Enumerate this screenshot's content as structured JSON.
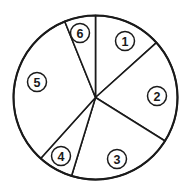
{
  "figure": {
    "kind": "pie-chart-diagram",
    "title": "",
    "background_color": "#ffffff",
    "stroke_color": "#1a1a1a",
    "fill_color": "#ffffff"
  },
  "geometry": {
    "center_x": 95.5,
    "center_y": 97.5,
    "radius": 82,
    "outline_stroke_width": 2.1,
    "divider_stroke_width": 1.6,
    "label_radius": 58,
    "label_ring_radius": 9.5
  },
  "chart_data": {
    "type": "pie",
    "title": "",
    "xlabel": "",
    "ylabel": "",
    "legend_position": "none",
    "grid": false,
    "labels_style": "circled-numbers-inside-slices",
    "start_angle_deg_from_12oclock": 0,
    "direction": "clockwise",
    "categories": [
      "1",
      "2",
      "3",
      "4",
      "5",
      "6"
    ],
    "values": [
      48,
      74,
      75,
      25,
      116,
      22
    ],
    "unit": "degrees",
    "boundary_angles_deg": [
      0,
      48,
      122,
      197,
      222,
      338,
      360
    ],
    "slices": [
      {
        "label": "1",
        "label_glyph": "①",
        "start_angle_deg": 0,
        "end_angle_deg": 48,
        "sweep_deg": 48,
        "fraction_percent": 13.3,
        "label_x": 125,
        "label_y": 41
      },
      {
        "label": "2",
        "label_glyph": "②",
        "start_angle_deg": 48,
        "end_angle_deg": 122,
        "sweep_deg": 74,
        "fraction_percent": 20.6,
        "label_x": 157,
        "label_y": 96
      },
      {
        "label": "3",
        "label_glyph": "③",
        "start_angle_deg": 122,
        "end_angle_deg": 197,
        "sweep_deg": 75,
        "fraction_percent": 20.8,
        "label_x": 117,
        "label_y": 159
      },
      {
        "label": "4",
        "label_glyph": "④",
        "start_angle_deg": 197,
        "end_angle_deg": 222,
        "sweep_deg": 25,
        "fraction_percent": 6.9,
        "label_x": 61,
        "label_y": 156
      },
      {
        "label": "5",
        "label_glyph": "⑤",
        "start_angle_deg": 222,
        "end_angle_deg": 338,
        "sweep_deg": 116,
        "fraction_percent": 32.2,
        "label_x": 37,
        "label_y": 82
      },
      {
        "label": "6",
        "label_glyph": "⑥",
        "start_angle_deg": 338,
        "end_angle_deg": 360,
        "sweep_deg": 22,
        "fraction_percent": 6.1,
        "label_x": 80,
        "label_y": 33
      }
    ]
  }
}
